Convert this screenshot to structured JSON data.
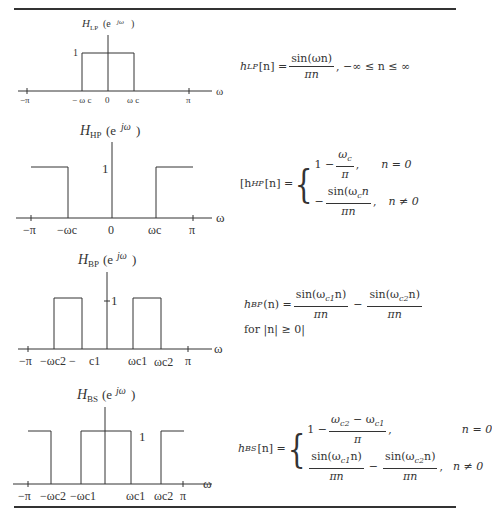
{
  "plots": [
    {
      "id": "lowpass",
      "title": {
        "main": "H",
        "sub": "LP",
        "arg_open": "(e",
        "sup": "jω",
        "arg_close": ")"
      },
      "height_label": "1",
      "axis_symbol": "ω",
      "ticks": [
        "−π",
        "− ω c",
        "0",
        "ω c",
        "π"
      ],
      "passbands": [
        [
          "-ωc",
          "ωc"
        ]
      ]
    },
    {
      "id": "highpass",
      "title": {
        "main": "H",
        "sub": "HP",
        "arg_open": "(e",
        "sup": "jω",
        "arg_close": ")"
      },
      "height_label": "1",
      "axis_symbol": "ω",
      "ticks": [
        "−π",
        "−ωc",
        "0",
        "ωc",
        "π"
      ],
      "passbands": [
        [
          "-π",
          "-ωc"
        ],
        [
          "ωc",
          "π"
        ]
      ]
    },
    {
      "id": "bandpass",
      "title": {
        "main": "H",
        "sub": "BP",
        "arg_open": "(e",
        "sup": "jω",
        "arg_close": ")"
      },
      "height_label": "1",
      "axis_symbol": "ω",
      "ticks": [
        "−π",
        "−ωc2 −",
        "c1",
        "ωc1",
        "ωc2",
        "π"
      ],
      "passbands": [
        [
          "-ωc2",
          "-ωc1"
        ],
        [
          "ωc1",
          "ωc2"
        ]
      ]
    },
    {
      "id": "bandstop",
      "title": {
        "main": "H",
        "sub": "BS",
        "arg_open": "(e",
        "sup": "jω",
        "arg_close": ")"
      },
      "height_label": "1",
      "axis_symbol": "ω",
      "ticks": [
        "−π",
        "−ωc2",
        "−ωc1",
        "ωc1",
        "ωc2",
        "π"
      ],
      "passbands": [
        [
          "-π",
          "-ωc2"
        ],
        [
          "-ωc1",
          "ωc1"
        ],
        [
          "ωc2",
          "π"
        ]
      ]
    }
  ],
  "equations": {
    "lp": {
      "lhs": "h",
      "lhs_sub": "LP",
      "lhs_arg": "[n] =",
      "num": "sin(ωn)",
      "den": "πn",
      "tail": ", −∞ ≤ n ≤ ∞"
    },
    "hp": {
      "lhs": "[h",
      "lhs_sub": "HP",
      "lhs_arg": "[n] =",
      "case1_pre": "1 −",
      "case1_num": "ω",
      "case1_num_sub": "c",
      "case1_den": "π",
      "case1_post": ",",
      "case1_cond": "n = 0",
      "case2_pre": "−",
      "case2_num": "sin(ω",
      "case2_num_sub": "c",
      "case2_num_end": "n",
      "case2_den": "πn",
      "case2_post": ",",
      "case2_cond": "n ≠ 0"
    },
    "bp": {
      "lhs": "h",
      "lhs_sub": "BP",
      "lhs_arg": "(n) =",
      "num1": "sin(ω",
      "num1_sub": "c1",
      "num1_end": "n)",
      "den1": "πn",
      "minus": "−",
      "num2": "sin(ω",
      "num2_sub": "c2",
      "num2_end": "n)",
      "den2": "πn",
      "line2": "for |n| ≥ 0|"
    },
    "bs": {
      "lhs": "h",
      "lhs_sub": "BS",
      "lhs_arg": "[n] =",
      "case1_pre": "1 −",
      "case1_num_a": "ω",
      "case1_num_a_sub": "c2",
      "case1_num_mid": " − ω",
      "case1_num_b_sub": "c1",
      "case1_den": "π",
      "case1_post": ",",
      "case1_cond": "n = 0",
      "case2_num1": "sin(ω",
      "case2_num1_sub": "c1",
      "case2_num1_end": "n)",
      "case2_den1": "πn",
      "case2_minus": "−",
      "case2_num2": "sin(ω",
      "case2_num2_sub": "c2",
      "case2_num2_end": "n)",
      "case2_den2": "πn",
      "case2_post": ",",
      "case2_cond": "n ≠ 0"
    }
  }
}
